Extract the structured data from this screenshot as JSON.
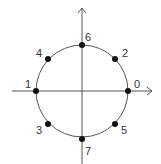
{
  "diagram": {
    "type": "unit-circle-points",
    "center": [
      82,
      91
    ],
    "radius": 46,
    "colors": {
      "line": "#555555",
      "point": "#111111",
      "label": "#333333"
    },
    "points": [
      {
        "label": "0",
        "angle_deg": 0,
        "x": 128,
        "y": 91,
        "lx": 134,
        "ly": 88
      },
      {
        "label": "1",
        "angle_deg": 180,
        "x": 36,
        "y": 91,
        "lx": 25,
        "ly": 88
      },
      {
        "label": "2",
        "angle_deg": 45,
        "x": 115,
        "y": 59,
        "lx": 122,
        "ly": 57
      },
      {
        "label": "3",
        "angle_deg": 225,
        "x": 48,
        "y": 124,
        "lx": 36,
        "ly": 134
      },
      {
        "label": "4",
        "angle_deg": 135,
        "x": 48,
        "y": 59,
        "lx": 36,
        "ly": 57
      },
      {
        "label": "5",
        "angle_deg": 315,
        "x": 115,
        "y": 124,
        "lx": 121,
        "ly": 134
      },
      {
        "label": "6",
        "angle_deg": 90,
        "x": 82,
        "y": 45,
        "lx": 85,
        "ly": 41
      },
      {
        "label": "7",
        "angle_deg": 270,
        "x": 82,
        "y": 139,
        "lx": 85,
        "ly": 155
      }
    ]
  }
}
